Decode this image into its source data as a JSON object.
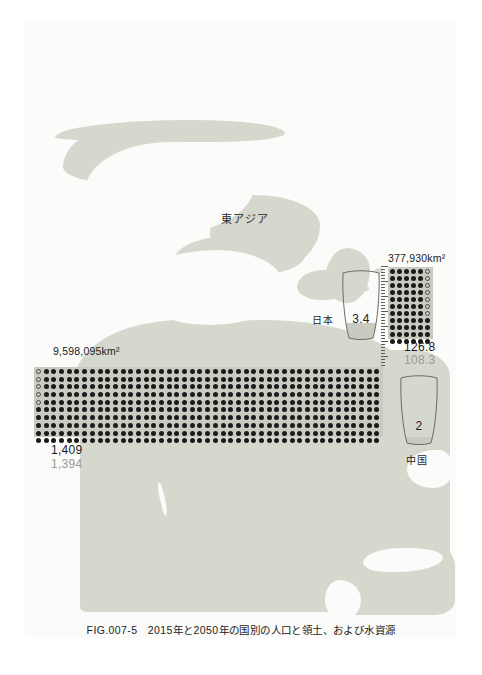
{
  "figure": {
    "caption": "FIG.007-5　2015年と2050年の国別の人口と領土、および水資源",
    "region_label": "東アジア",
    "background_color": "#fbfbf9",
    "land_color": "#d6d8cd",
    "dot_color": "#1b1b1b",
    "future_text_color": "#9a9a96"
  },
  "countries": [
    {
      "key": "china",
      "name": "中国",
      "area_label": "9,598,095km²",
      "population_2015": "1,409",
      "population_2050": "1,394",
      "water_value": "2",
      "grid": {
        "cols": 45,
        "rows": 10,
        "hollow_count": 5
      },
      "glass_fill_percent": 14
    },
    {
      "key": "japan",
      "name": "日本",
      "area_label": "377,930km²",
      "population_2015": "126.8",
      "population_2050": "108.3",
      "water_value": "3.4",
      "grid": {
        "cols": 6,
        "rows": 11,
        "hollow_count": 7
      },
      "glass_fill_percent": 26
    }
  ],
  "chart_data": {
    "type": "bar",
    "title": "2015年と2050年の国別の人口と領土、および水資源",
    "xlabel": "",
    "ylabel": "",
    "categories": [
      "中国",
      "日本"
    ],
    "series": [
      {
        "name": "人口 2015 (百万人)",
        "values": [
          1409,
          126.8
        ]
      },
      {
        "name": "人口 2050 (百万人)",
        "values": [
          1394,
          108.3
        ]
      },
      {
        "name": "領土 (km²)",
        "values": [
          9598095,
          377930
        ]
      },
      {
        "name": "水資源 (千m³/人)",
        "values": [
          2,
          3.4
        ]
      }
    ],
    "annotations": [
      "東アジア",
      "中国: 9,598,095km² / 1,409 / 1,394 / 水 2",
      "日本: 377,930km² / 126.8 / 108.3 / 水 3.4"
    ],
    "legend_position": "none",
    "grid": false
  }
}
